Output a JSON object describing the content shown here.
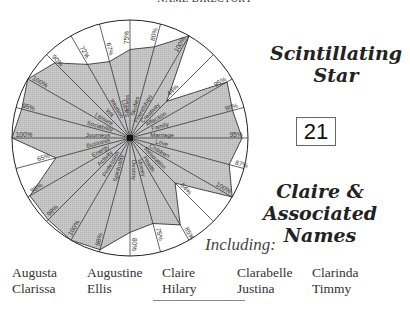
{
  "header": {
    "title": "NAME DIRECTORY"
  },
  "title": {
    "line1": "Scintillating",
    "line2": "Star"
  },
  "number": "21",
  "subtitle": {
    "line1": "Claire &",
    "line2": "Associated Names"
  },
  "including_label": "Including:",
  "names": [
    "Augusta",
    "Augustine",
    "Claire",
    "Clarabelle",
    "Clarinda",
    "Clarissa",
    "Ellis",
    "Hilary",
    "Justina",
    "Timmy"
  ],
  "colors": {
    "fill": "#c8c8c8",
    "stroke": "#222222",
    "background": "#ffffff"
  },
  "chart_data": {
    "type": "radar",
    "title": "Scintillating Star",
    "categories": [
      "Success",
      "Studies",
      "Friendships",
      "Creativity",
      "Affection",
      "Family",
      "Marriage",
      "Love",
      "Children",
      "Relaxation",
      "Health",
      "Money",
      "Destiny",
      "Spirituality",
      "Profession",
      "Activity",
      "Energy",
      "Business",
      "Journeys",
      "Sociability",
      "Leisure",
      "Wit",
      "Intuition",
      "Luck"
    ],
    "values": [
      75,
      80,
      100,
      44,
      95,
      90,
      95,
      87,
      100,
      54,
      85,
      75,
      80,
      98,
      100,
      98,
      98,
      65,
      100,
      95,
      100,
      90,
      72,
      67
    ],
    "labels": [
      "75%",
      "80%",
      "100%",
      "44%",
      "95%",
      "90%",
      "95%",
      "87%",
      "100%",
      "54%",
      "85%",
      "75%",
      "80%",
      "98%",
      "100%",
      "98%",
      "98%",
      "65%",
      "100%",
      "95%",
      "100%",
      "90%",
      "72%",
      "67%"
    ],
    "ylim": [
      0,
      100
    ],
    "grid": false,
    "legend": "none"
  }
}
